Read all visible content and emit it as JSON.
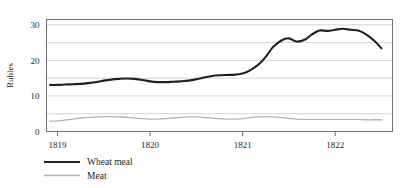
{
  "chart_data": {
    "type": "line",
    "title": "",
    "xlabel": "",
    "ylabel": "Rubles",
    "xlim": [
      1818.88,
      1822.62
    ],
    "ylim": [
      0,
      31.5
    ],
    "yticks": [
      0,
      10,
      20,
      30
    ],
    "ytick_labels": [
      "0",
      "10",
      "20",
      "30"
    ],
    "gridlines_y": [
      0,
      5,
      10,
      15,
      20,
      25,
      30
    ],
    "xticks": [
      1819,
      1820,
      1821,
      1822
    ],
    "xtick_labels": [
      "1819",
      "1820",
      "1821",
      "1822"
    ],
    "grid": true,
    "legend_position": "below-left",
    "series": [
      {
        "name": "Wheat meal",
        "color": "#231f20",
        "width": 2.1,
        "x": [
          1818.92,
          1819.0,
          1819.08,
          1819.17,
          1819.25,
          1819.33,
          1819.42,
          1819.5,
          1819.58,
          1819.67,
          1819.75,
          1819.83,
          1819.92,
          1820.0,
          1820.08,
          1820.17,
          1820.25,
          1820.33,
          1820.42,
          1820.5,
          1820.58,
          1820.67,
          1820.75,
          1820.83,
          1820.92,
          1821.0,
          1821.08,
          1821.17,
          1821.25,
          1821.33,
          1821.42,
          1821.5,
          1821.58,
          1821.67,
          1821.75,
          1821.83,
          1821.92,
          1822.0,
          1822.08,
          1822.17,
          1822.25,
          1822.33,
          1822.42,
          1822.5
        ],
        "y": [
          13.1,
          13.1,
          13.2,
          13.3,
          13.4,
          13.6,
          13.9,
          14.3,
          14.6,
          14.8,
          14.9,
          14.8,
          14.5,
          14.1,
          13.9,
          13.9,
          14.0,
          14.1,
          14.3,
          14.7,
          15.2,
          15.6,
          15.8,
          15.9,
          16.0,
          16.3,
          17.2,
          18.8,
          21.0,
          23.8,
          25.6,
          26.2,
          25.3,
          25.8,
          27.3,
          28.4,
          28.3,
          28.6,
          28.9,
          28.6,
          28.4,
          27.4,
          25.6,
          23.4
        ]
      },
      {
        "name": "Meat",
        "color": "#b3b3b3",
        "width": 1.3,
        "x": [
          1818.92,
          1819.0,
          1819.08,
          1819.17,
          1819.25,
          1819.33,
          1819.42,
          1819.5,
          1819.58,
          1819.67,
          1819.75,
          1819.83,
          1819.92,
          1820.0,
          1820.08,
          1820.17,
          1820.25,
          1820.33,
          1820.42,
          1820.5,
          1820.58,
          1820.67,
          1820.75,
          1820.83,
          1820.92,
          1821.0,
          1821.08,
          1821.17,
          1821.25,
          1821.33,
          1821.42,
          1821.5,
          1821.58,
          1821.67,
          1821.75,
          1821.83,
          1821.92,
          1822.0,
          1822.08,
          1822.17,
          1822.25,
          1822.33,
          1822.42,
          1822.5
        ],
        "y": [
          2.9,
          3.0,
          3.2,
          3.5,
          3.8,
          4.0,
          4.1,
          4.2,
          4.2,
          4.1,
          4.0,
          3.8,
          3.6,
          3.5,
          3.5,
          3.6,
          3.8,
          4.0,
          4.1,
          4.1,
          4.0,
          3.8,
          3.6,
          3.5,
          3.5,
          3.6,
          3.9,
          4.1,
          4.2,
          4.1,
          3.9,
          3.7,
          3.5,
          3.4,
          3.4,
          3.4,
          3.4,
          3.4,
          3.4,
          3.4,
          3.4,
          3.3,
          3.3,
          3.3
        ]
      }
    ]
  },
  "legend": {
    "items": [
      {
        "label": "Wheat meal",
        "color": "#231f20"
      },
      {
        "label": "Meat",
        "color": "#b3b3b3"
      }
    ]
  }
}
